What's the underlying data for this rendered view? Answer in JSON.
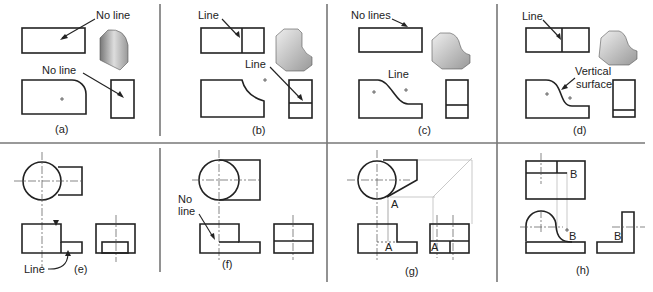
{
  "figure": {
    "panels": [
      {
        "id": "a",
        "caption": "(a)",
        "callouts": [
          "No line",
          "No line"
        ]
      },
      {
        "id": "b",
        "caption": "(b)",
        "callouts": [
          "Line",
          "Line"
        ]
      },
      {
        "id": "c",
        "caption": "(c)",
        "callouts": [
          "No lines",
          "Line"
        ]
      },
      {
        "id": "d",
        "caption": "(d)",
        "callouts": [
          "Line",
          "Vertical",
          "surface"
        ]
      },
      {
        "id": "e",
        "caption": "(e)",
        "callouts": [
          "Line"
        ]
      },
      {
        "id": "f",
        "caption": "(f)",
        "callouts": [
          "No",
          "line"
        ]
      },
      {
        "id": "g",
        "caption": "(g)",
        "callouts": [
          "A",
          "A",
          "A"
        ]
      },
      {
        "id": "h",
        "caption": "(h)",
        "callouts": [
          "B",
          "B",
          "B"
        ]
      }
    ]
  },
  "colors": {
    "line": "#222222",
    "divider": "#777777",
    "projection": "#bbbbbb"
  }
}
